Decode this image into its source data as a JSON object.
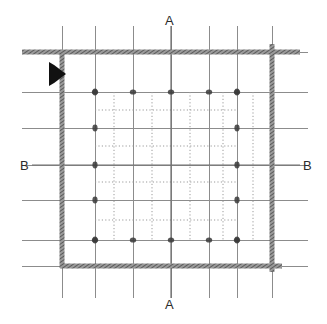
{
  "drawing": {
    "type": "structural-floor-plan",
    "width": 327,
    "height": 324,
    "background_color": "#ffffff"
  },
  "section_labels": {
    "a_top": "A",
    "a_bottom": "A",
    "b_left": "B",
    "b_right": "B"
  },
  "section_lines": {
    "a_a": {
      "name": "A-A",
      "orientation": "vertical",
      "x": 171,
      "y_start": 26,
      "y_end": 298
    },
    "b_b": {
      "name": "B-B",
      "orientation": "horizontal",
      "y": 165,
      "x_start": 32,
      "x_end": 300
    }
  },
  "direction_marker": {
    "name": "view-direction-arrow",
    "shape": "solid-triangle",
    "direction": "right",
    "color": "#111111",
    "x": 49,
    "y": 62,
    "width": 17,
    "height": 24
  },
  "walls": {
    "color": "#6d6d6d",
    "hatch_color": "#4a4a4a",
    "thickness": 5,
    "top": {
      "x1": 22,
      "y1": 52,
      "x2": 300,
      "y2": 52
    },
    "bottom": {
      "x1": 60,
      "y1": 266,
      "x2": 282,
      "y2": 266
    },
    "left": {
      "x1": 62,
      "y1": 52,
      "x2": 62,
      "y2": 268
    },
    "right": {
      "x1": 272,
      "y1": 44,
      "x2": 272,
      "y2": 272
    }
  },
  "grid": {
    "solid_color": "#8c8c8c",
    "dotted_color": "#9a9a9a",
    "node_color": "#3c3c3c",
    "vertical_lines_x": [
      62,
      95,
      133,
      171,
      209,
      237,
      272
    ],
    "horizontal_lines_y": [
      52,
      92,
      128,
      165,
      200,
      240,
      266
    ],
    "dotted_vertical_x": [
      114,
      152,
      190,
      223,
      253
    ],
    "dotted_horizontal_y": [
      110,
      146,
      182,
      220
    ],
    "extent": {
      "v_top": 26,
      "v_bottom": 298,
      "h_left": 22,
      "h_right": 308
    },
    "inner_extent": {
      "left": 95,
      "right": 237,
      "top": 92,
      "bottom": 240
    }
  },
  "nodes": {
    "description": "column / structural node markers at grid intersections",
    "color": "#3a3a3a",
    "major_x": [
      95,
      133,
      171,
      209,
      237
    ],
    "major_y": [
      92,
      240
    ],
    "edge_x": [
      95,
      237
    ],
    "edge_y": [
      92,
      128,
      165,
      200,
      240
    ]
  }
}
